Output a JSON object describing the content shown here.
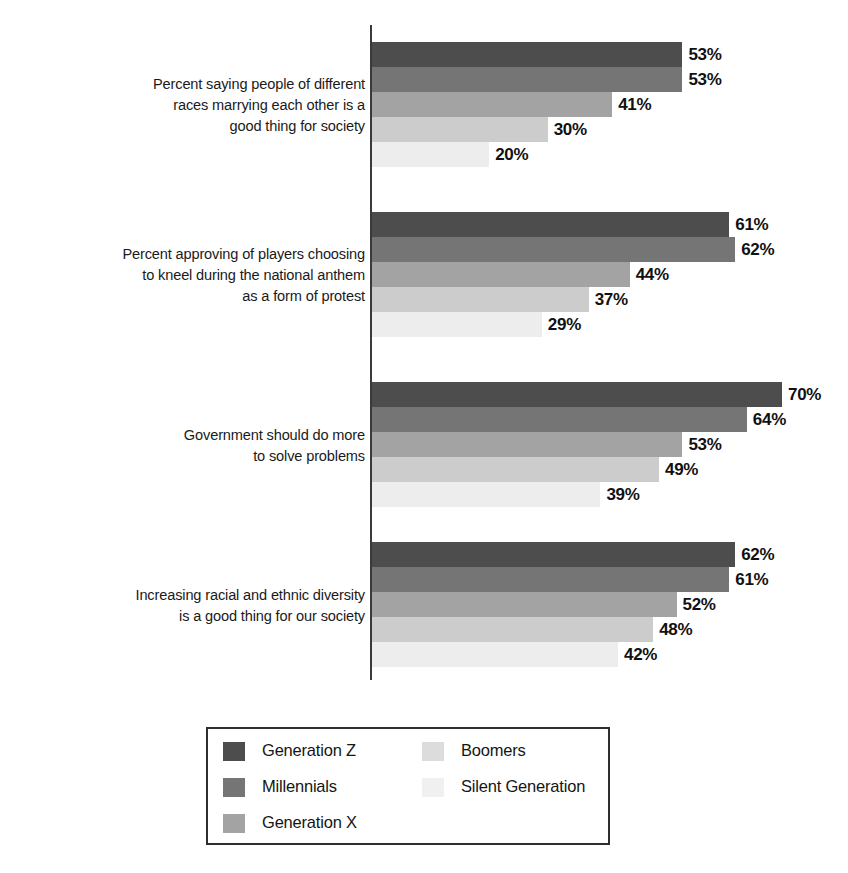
{
  "chart_data": {
    "type": "bar",
    "orientation": "horizontal",
    "title": "",
    "subtitle": "",
    "xlabel": "",
    "ylabel": "",
    "xlim": [
      0,
      100
    ],
    "grid": false,
    "value_suffix": "%",
    "legend_position": "bottom",
    "categories": [
      "Percent saying people of different\nraces marrying each other is a\ngood thing for society",
      "Percent approving of players choosing\nto kneel during the national anthem\nas a form of protest",
      "Government should do more\nto solve problems",
      "Increasing racial and ethnic diversity\nis a good thing for our society"
    ],
    "series": [
      {
        "name": "Generation Z",
        "color": "#4d4d4d",
        "values": [
          53,
          61,
          70,
          62
        ]
      },
      {
        "name": "Millennials",
        "color": "#757575",
        "values": [
          53,
          62,
          64,
          61
        ]
      },
      {
        "name": "Generation X",
        "color": "#a3a3a3",
        "values": [
          41,
          44,
          53,
          52
        ]
      },
      {
        "name": "Boomers",
        "color": "#cccccc",
        "values": [
          30,
          37,
          49,
          48
        ]
      },
      {
        "name": "Silent Generation",
        "color": "#ededed",
        "values": [
          20,
          29,
          39,
          42
        ]
      }
    ],
    "value_labels": [
      [
        "53%",
        "53%",
        "41%",
        "30%",
        "20%"
      ],
      [
        "61%",
        "62%",
        "44%",
        "37%",
        "29%"
      ],
      [
        "70%",
        "64%",
        "53%",
        "49%",
        "39%"
      ],
      [
        "62%",
        "61%",
        "52%",
        "48%",
        "42%"
      ]
    ]
  },
  "groups": [
    {
      "label": "Percent saying people of different\nraces marrying each other is a\ngood thing for society",
      "bars": [
        {
          "series": "Generation Z",
          "value": 53,
          "label": "53%",
          "color": "#4d4d4d"
        },
        {
          "series": "Millennials",
          "value": 53,
          "label": "53%",
          "color": "#757575"
        },
        {
          "series": "Generation X",
          "value": 41,
          "label": "41%",
          "color": "#a3a3a3"
        },
        {
          "series": "Boomers",
          "value": 30,
          "label": "30%",
          "color": "#cccccc"
        },
        {
          "series": "Silent Generation",
          "value": 20,
          "label": "20%",
          "color": "#ededed"
        }
      ]
    },
    {
      "label": "Percent approving of players choosing\nto kneel during the national anthem\nas a form of protest",
      "bars": [
        {
          "series": "Generation Z",
          "value": 61,
          "label": "61%",
          "color": "#4d4d4d"
        },
        {
          "series": "Millennials",
          "value": 62,
          "label": "62%",
          "color": "#757575"
        },
        {
          "series": "Generation X",
          "value": 44,
          "label": "44%",
          "color": "#a3a3a3"
        },
        {
          "series": "Boomers",
          "value": 37,
          "label": "37%",
          "color": "#cccccc"
        },
        {
          "series": "Silent Generation",
          "value": 29,
          "label": "29%",
          "color": "#ededed"
        }
      ]
    },
    {
      "label": "Government should do more\nto solve problems",
      "bars": [
        {
          "series": "Generation Z",
          "value": 70,
          "label": "70%",
          "color": "#4d4d4d"
        },
        {
          "series": "Millennials",
          "value": 64,
          "label": "64%",
          "color": "#757575"
        },
        {
          "series": "Generation X",
          "value": 53,
          "label": "53%",
          "color": "#a3a3a3"
        },
        {
          "series": "Boomers",
          "value": 49,
          "label": "49%",
          "color": "#cccccc"
        },
        {
          "series": "Silent Generation",
          "value": 39,
          "label": "39%",
          "color": "#ededed"
        }
      ]
    },
    {
      "label": "Increasing racial and ethnic diversity\nis a good thing for our society",
      "bars": [
        {
          "series": "Generation Z",
          "value": 62,
          "label": "62%",
          "color": "#4d4d4d"
        },
        {
          "series": "Millennials",
          "value": 61,
          "label": "61%",
          "color": "#757575"
        },
        {
          "series": "Generation X",
          "value": 52,
          "label": "52%",
          "color": "#a3a3a3"
        },
        {
          "series": "Boomers",
          "value": 48,
          "label": "48%",
          "color": "#cccccc"
        },
        {
          "series": "Silent Generation",
          "value": 42,
          "label": "42%",
          "color": "#ededed"
        }
      ]
    }
  ],
  "legend": {
    "items": [
      {
        "label": "Generation Z",
        "color": "#4d4d4d",
        "column": 1,
        "row": 1
      },
      {
        "label": "Millennials",
        "color": "#757575",
        "column": 1,
        "row": 2
      },
      {
        "label": "Generation X",
        "color": "#a3a3a3",
        "column": 1,
        "row": 3
      },
      {
        "label": "Boomers",
        "color": "#dcdcdc",
        "column": 2,
        "row": 1
      },
      {
        "label": "Silent Generation",
        "color": "#f0f0f0",
        "column": 2,
        "row": 2
      }
    ]
  },
  "axis": {
    "px_per_percent": 5.857,
    "origin_x": 372,
    "bar_height": 25
  }
}
